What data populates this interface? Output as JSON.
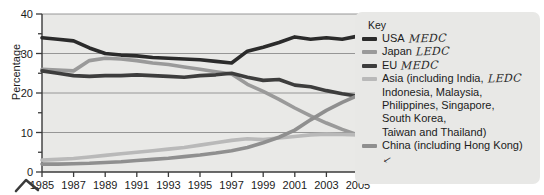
{
  "chart_data": {
    "type": "line",
    "title": "",
    "xlabel": "",
    "ylabel": "Percentage",
    "xlim": [
      1985,
      2005
    ],
    "ylim": [
      0,
      40
    ],
    "grid": true,
    "grid_lines": [
      10,
      20,
      30,
      40
    ],
    "y_ticks": [
      0,
      5,
      10,
      15,
      20,
      25,
      30,
      35,
      40
    ],
    "y_tick_labels": [
      "0",
      "",
      "10",
      "",
      "20",
      "",
      "30",
      "",
      "40"
    ],
    "legend_position": "right",
    "categories": [
      1985,
      1986,
      1987,
      1988,
      1989,
      1990,
      1991,
      1992,
      1993,
      1994,
      1995,
      1996,
      1997,
      1998,
      1999,
      2000,
      2001,
      2002,
      2003,
      2004,
      2005
    ],
    "x_tick_labels": [
      "1985",
      "1987",
      "1989",
      "1991",
      "1993",
      "1995",
      "1997",
      "1999",
      "2001",
      "2003",
      "2005"
    ],
    "series": [
      {
        "name": "USA",
        "color": "#2b2b2b",
        "values": [
          34.0,
          33.6,
          33.2,
          31.4,
          30.0,
          29.6,
          29.4,
          29.0,
          28.8,
          28.6,
          28.4,
          28.0,
          27.6,
          30.6,
          31.6,
          32.8,
          34.2,
          33.6,
          34.0,
          33.6,
          34.4
        ]
      },
      {
        "name": "Japan",
        "color": "#9a9a9a",
        "values": [
          26.0,
          25.8,
          25.6,
          28.2,
          28.8,
          28.6,
          28.2,
          27.6,
          27.2,
          26.6,
          26.0,
          25.4,
          24.8,
          22.2,
          20.4,
          18.4,
          16.2,
          14.2,
          12.4,
          10.8,
          9.4
        ]
      },
      {
        "name": "EU",
        "color": "#3d3d3d",
        "values": [
          25.6,
          25.0,
          24.4,
          24.2,
          24.4,
          24.4,
          24.6,
          24.4,
          24.2,
          24.0,
          24.4,
          24.6,
          25.0,
          24.0,
          23.2,
          23.4,
          22.0,
          21.6,
          20.6,
          19.8,
          19.2
        ]
      },
      {
        "name": "Asia",
        "color": "#b9b9b9",
        "values": [
          3.0,
          3.2,
          3.4,
          3.8,
          4.2,
          4.6,
          5.0,
          5.4,
          5.8,
          6.2,
          6.8,
          7.4,
          8.0,
          8.4,
          8.2,
          8.6,
          9.0,
          9.4,
          9.6,
          9.5,
          9.4
        ]
      },
      {
        "name": "China",
        "color": "#8f8f8f",
        "values": [
          2.0,
          2.0,
          2.1,
          2.2,
          2.4,
          2.6,
          2.9,
          3.2,
          3.5,
          3.9,
          4.3,
          4.8,
          5.4,
          6.2,
          7.4,
          8.8,
          10.6,
          13.2,
          15.6,
          17.6,
          19.4
        ]
      }
    ]
  },
  "axis": {
    "y_title": "Percentage",
    "y_labels": [
      "40",
      "30",
      "20",
      "10",
      "0"
    ],
    "x_labels": [
      "1985",
      "1987",
      "1989",
      "1991",
      "1993",
      "1995",
      "1997",
      "1999",
      "2001",
      "2003",
      "2005"
    ]
  },
  "legend": {
    "title": "Key",
    "items": [
      {
        "label": "USA",
        "annotation": "MEDC",
        "color": "#2b2b2b",
        "swatch_name": "legend-swatch-usa"
      },
      {
        "label": "Japan",
        "annotation": "LEDC",
        "color": "#9a9a9a",
        "swatch_name": "legend-swatch-japan"
      },
      {
        "label": "EU",
        "annotation": "MEDC",
        "color": "#3d3d3d",
        "swatch_name": "legend-swatch-eu"
      },
      {
        "label": "Asia (including India,\nIndonesia, Malaysia,\nPhilippines, Singapore,\nSouth Korea,\nTaiwan and Thailand)",
        "annotation": "LEDC",
        "color": "#b9b9b9",
        "swatch_name": "legend-swatch-asia"
      },
      {
        "label": "China (including Hong Kong)",
        "annotation": "✓",
        "color": "#8f8f8f",
        "swatch_name": "legend-swatch-china"
      }
    ]
  },
  "colors": {
    "plot_background": "#e9e9e7",
    "legend_background": "#e8e8e6",
    "grid": "#8c8c8c",
    "axis": "#3a3a3a",
    "text": "#1b1b1b"
  }
}
